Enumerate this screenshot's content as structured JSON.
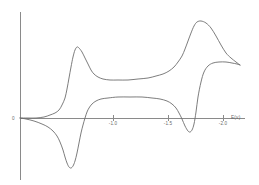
{
  "chart_data": {
    "type": "line",
    "title": "",
    "subtitle": "",
    "xlabel": "E(v)",
    "ylabel": "",
    "origin_label": "0",
    "xlim": [
      0.0,
      -2.3
    ],
    "ylim": [
      -1.0,
      1.0
    ],
    "grid": false,
    "legend_position": "none",
    "axis_color": "#8a8a8a",
    "trace_color": "#6e6e6e",
    "x_ticks": [
      {
        "value": -1.0,
        "label": "-1.0"
      },
      {
        "value": -1.5,
        "label": "-1.5"
      },
      {
        "value": -2.0,
        "label": "-2.0"
      }
    ],
    "y_ticks": [],
    "annotations": [],
    "series": [
      {
        "name": "forward-cathodic-scan",
        "description": "Forward (negative-going) scan showing two cathodic reduction peaks",
        "points_px": [
          [
            20,
            118
          ],
          [
            26,
            119
          ],
          [
            34,
            121
          ],
          [
            42,
            124
          ],
          [
            48,
            127
          ],
          [
            53,
            131
          ],
          [
            57,
            136
          ],
          [
            60,
            142
          ],
          [
            63,
            150
          ],
          [
            65,
            157
          ],
          [
            67,
            163
          ],
          [
            69,
            167
          ],
          [
            71,
            168
          ],
          [
            73,
            166
          ],
          [
            75,
            161
          ],
          [
            77,
            153
          ],
          [
            79,
            143
          ],
          [
            81,
            133
          ],
          [
            83,
            125
          ],
          [
            85,
            118
          ],
          [
            87,
            112
          ],
          [
            89,
            108
          ],
          [
            92,
            104
          ],
          [
            96,
            101
          ],
          [
            101,
            99
          ],
          [
            108,
            98
          ],
          [
            118,
            97
          ],
          [
            130,
            97
          ],
          [
            142,
            97
          ],
          [
            152,
            98
          ],
          [
            160,
            99
          ],
          [
            167,
            101
          ],
          [
            172,
            104
          ],
          [
            176,
            108
          ],
          [
            179,
            113
          ],
          [
            182,
            119
          ],
          [
            185,
            126
          ],
          [
            188,
            131
          ],
          [
            190,
            132
          ],
          [
            192,
            130
          ],
          [
            194,
            124
          ],
          [
            196,
            112
          ],
          [
            198,
            97
          ],
          [
            201,
            82
          ],
          [
            204,
            72
          ],
          [
            208,
            66
          ],
          [
            213,
            63
          ],
          [
            219,
            62
          ],
          [
            226,
            62
          ],
          [
            232,
            63
          ],
          [
            237,
            64
          ],
          [
            240,
            65
          ]
        ]
      },
      {
        "name": "reverse-anodic-scan",
        "description": "Reverse (positive-going) scan showing two anodic oxidation peaks",
        "points_px": [
          [
            240,
            65
          ],
          [
            236,
            62
          ],
          [
            231,
            58
          ],
          [
            226,
            53
          ],
          [
            221,
            45
          ],
          [
            216,
            36
          ],
          [
            211,
            28
          ],
          [
            206,
            23
          ],
          [
            201,
            21
          ],
          [
            197,
            22
          ],
          [
            194,
            26
          ],
          [
            191,
            33
          ],
          [
            188,
            41
          ],
          [
            185,
            49
          ],
          [
            182,
            56
          ],
          [
            178,
            62
          ],
          [
            174,
            67
          ],
          [
            169,
            71
          ],
          [
            163,
            74
          ],
          [
            156,
            76
          ],
          [
            148,
            78
          ],
          [
            138,
            79
          ],
          [
            128,
            80
          ],
          [
            118,
            80
          ],
          [
            110,
            80
          ],
          [
            103,
            79
          ],
          [
            98,
            77
          ],
          [
            94,
            74
          ],
          [
            91,
            70
          ],
          [
            88,
            64
          ],
          [
            85,
            58
          ],
          [
            82,
            52
          ],
          [
            79,
            48
          ],
          [
            77,
            47
          ],
          [
            75,
            50
          ],
          [
            73,
            57
          ],
          [
            71,
            67
          ],
          [
            69,
            78
          ],
          [
            67,
            89
          ],
          [
            65,
            98
          ],
          [
            62,
            105
          ],
          [
            59,
            110
          ],
          [
            55,
            113
          ],
          [
            50,
            115
          ],
          [
            44,
            117
          ],
          [
            36,
            118
          ],
          [
            28,
            118
          ],
          [
            20,
            118
          ]
        ]
      }
    ]
  },
  "geometry": {
    "y_axis_x": 20,
    "y_axis_top": 12,
    "y_axis_bottom": 180,
    "x_axis_y": 118,
    "x_axis_left": 20,
    "x_axis_right": 245,
    "tick_px": {
      "-1.0": 113,
      "-1.5": 168,
      "-2.0": 223
    },
    "tick_label_y": 125,
    "axis_title_x": 231,
    "axis_title_y": 119,
    "origin_label_x": 12,
    "origin_label_y": 120
  }
}
